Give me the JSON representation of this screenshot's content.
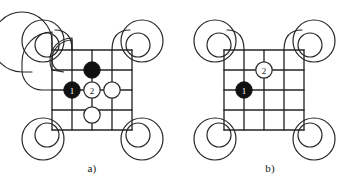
{
  "figure": {
    "background_color": "#ffffff",
    "line_color": "#262626",
    "stone_black_color": "#111111",
    "stone_white_color": "#ffffff",
    "stone_outline_color": "#262626",
    "panel_count": 2
  },
  "panels": [
    {
      "id": "a",
      "caption": "a)",
      "board": {
        "grid_lines": 5,
        "grid_left": 52,
        "grid_top": 50,
        "spacing": 20,
        "loop_radii": [
          10,
          20,
          30
        ],
        "description": "5 by 5 grid with edge lines curving into concentric loops at each corner"
      },
      "stones": [
        {
          "name": "black-stone-1",
          "color": "black",
          "label": "1",
          "col": 1,
          "row": 2,
          "cx": 72,
          "cy": 90,
          "radius": 8
        },
        {
          "name": "black-stone-plain",
          "color": "black",
          "label": "",
          "col": 2,
          "row": 1,
          "cx": 92,
          "cy": 70,
          "radius": 8
        },
        {
          "name": "white-stone-2",
          "color": "white",
          "label": "2",
          "col": 2,
          "row": 2,
          "cx": 92,
          "cy": 90,
          "radius": 8
        },
        {
          "name": "white-stone-right",
          "color": "white",
          "label": "",
          "col": 3,
          "row": 2,
          "cx": 112,
          "cy": 90,
          "radius": 8
        },
        {
          "name": "white-stone-below",
          "color": "white",
          "label": "",
          "col": 2,
          "row": 3,
          "cx": 92,
          "cy": 115,
          "radius": 8
        }
      ]
    },
    {
      "id": "b",
      "caption": "b)",
      "board": {
        "grid_lines": 5,
        "grid_left": 47,
        "grid_top": 50,
        "spacing": 20,
        "loop_radii": [
          10,
          20,
          30
        ],
        "description": "5 by 5 grid with edge lines curving into concentric loops at each corner"
      },
      "stones": [
        {
          "name": "black-stone-1",
          "color": "black",
          "label": "1",
          "col": 1,
          "row": 2,
          "cx": 67,
          "cy": 90,
          "radius": 8
        },
        {
          "name": "white-stone-2",
          "color": "white",
          "label": "2",
          "col": 2,
          "row": 1,
          "cx": 87,
          "cy": 70,
          "radius": 8
        }
      ]
    }
  ]
}
